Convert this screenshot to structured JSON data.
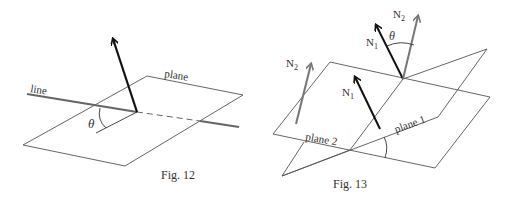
{
  "figures": [
    {
      "id": "fig12",
      "caption": "Fig. 12",
      "labels": {
        "line": "line",
        "plane": "plane",
        "angle": "θ"
      },
      "colors": {
        "plane": "#555555",
        "line": "#666666",
        "vector": "#111111"
      }
    },
    {
      "id": "fig13",
      "caption": "Fig. 13",
      "labels": {
        "plane1": "plane 1",
        "plane2": "plane 2",
        "angle": "θ",
        "normal1": "N",
        "normal1_sub": "1",
        "normal2": "N",
        "normal2_sub": "2"
      },
      "colors": {
        "plane": "#555555",
        "normal1": "#111111",
        "normal2": "#777777"
      }
    }
  ]
}
